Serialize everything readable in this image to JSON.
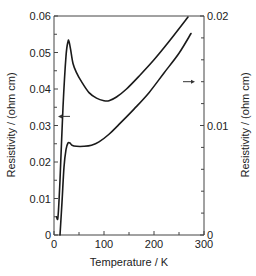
{
  "chart_data": {
    "type": "line",
    "title": "",
    "xlabel": "Temperature / K",
    "ylabel_left": "Resistivity / (ohm cm)",
    "ylabel_right": "Resistivity / (ohm cm)",
    "xlim": [
      0,
      300
    ],
    "ylim_left": [
      0,
      0.06
    ],
    "ylim_right": [
      0,
      0.02
    ],
    "x_ticks": [
      "0",
      "100",
      "200",
      "300"
    ],
    "y_ticks_left": [
      "0",
      "0.01",
      "0.02",
      "0.03",
      "0.04",
      "0.05",
      "0.06"
    ],
    "y_ticks_right": [
      "0",
      "0.01",
      "0.02"
    ],
    "grid": false,
    "legend": null,
    "annotations": [
      {
        "type": "arrow",
        "direction": "left",
        "meaning": "upper curve uses left axis",
        "x": 20,
        "y_left": 0.0325
      },
      {
        "type": "arrow",
        "direction": "right",
        "meaning": "lower curve uses right axis",
        "x": 270,
        "y_left": 0.042
      }
    ],
    "series": [
      {
        "name": "upper curve (left axis)",
        "axis": "left",
        "x": [
          5,
          8,
          12,
          18,
          24,
          28,
          30,
          33,
          38,
          45,
          55,
          70,
          85,
          100,
          110,
          125,
          145,
          170,
          200,
          230,
          268
        ],
        "y": [
          0.005,
          0.005,
          0.015,
          0.035,
          0.049,
          0.053,
          0.053,
          0.051,
          0.047,
          0.0445,
          0.042,
          0.039,
          0.0375,
          0.0368,
          0.0368,
          0.0378,
          0.04,
          0.0435,
          0.048,
          0.053,
          0.0597
        ]
      },
      {
        "name": "lower curve (right axis)",
        "axis": "right",
        "x": [
          12,
          16,
          20,
          24,
          28,
          32,
          36,
          45,
          60,
          75,
          90,
          110,
          130,
          160,
          190,
          220,
          250,
          274
        ],
        "y": [
          0.0,
          0.003,
          0.0062,
          0.0078,
          0.0084,
          0.0084,
          0.0082,
          0.0081,
          0.0081,
          0.0082,
          0.0085,
          0.0092,
          0.0101,
          0.0115,
          0.013,
          0.0148,
          0.0166,
          0.0184
        ]
      }
    ]
  }
}
